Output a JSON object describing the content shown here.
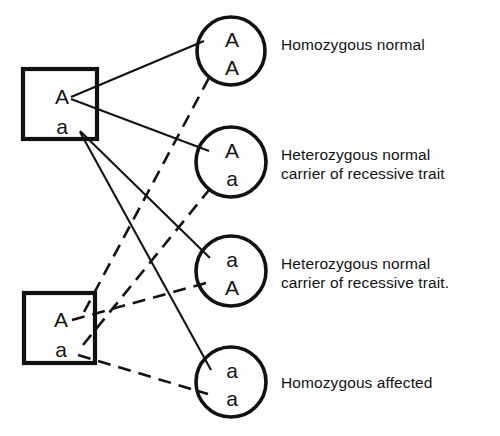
{
  "diagram": {
    "type": "genetic-inheritance-cross",
    "title_visible": false,
    "parents": [
      {
        "id": "parent-top",
        "shape": "square",
        "genotype": "Aa",
        "allele_top": "A",
        "allele_bottom": "a",
        "line_style": "solid",
        "x": 23,
        "y": 69,
        "width": 74,
        "height": 70
      },
      {
        "id": "parent-bottom",
        "shape": "square",
        "genotype": "Aa",
        "allele_top": "A",
        "allele_bottom": "a",
        "line_style": "dashed",
        "x": 24,
        "y": 293,
        "width": 71,
        "height": 70
      }
    ],
    "offspring": [
      {
        "id": "offspring-1",
        "shape": "circle",
        "genotype": "AA",
        "allele_top": "A",
        "allele_bottom": "A",
        "cx": 231,
        "cy": 51,
        "r": 34,
        "label": [
          "Homozygous normal"
        ]
      },
      {
        "id": "offspring-2",
        "shape": "circle",
        "genotype": "Aa",
        "allele_top": "A",
        "allele_bottom": "a",
        "cx": 231,
        "cy": 162,
        "r": 35,
        "label": [
          "Heterozygous normal",
          "carrier of recessive trait"
        ]
      },
      {
        "id": "offspring-3",
        "shape": "circle",
        "genotype": "aA",
        "allele_top": "a",
        "allele_bottom": "A",
        "cx": 231,
        "cy": 271,
        "r": 35,
        "label": [
          "Heterozygous normal",
          "carrier of recessive trait."
        ]
      },
      {
        "id": "offspring-4",
        "shape": "circle",
        "genotype": "aa",
        "allele_top": "a",
        "allele_bottom": "a",
        "cx": 231,
        "cy": 382,
        "r": 35,
        "label": [
          "Homozygous affected"
        ]
      }
    ],
    "colors": {
      "stroke": "#131313",
      "background": "#fefefe",
      "text": "#131313"
    },
    "legend": {
      "solid_means": "allele from top parent",
      "dashed_means": "allele from bottom parent"
    }
  }
}
